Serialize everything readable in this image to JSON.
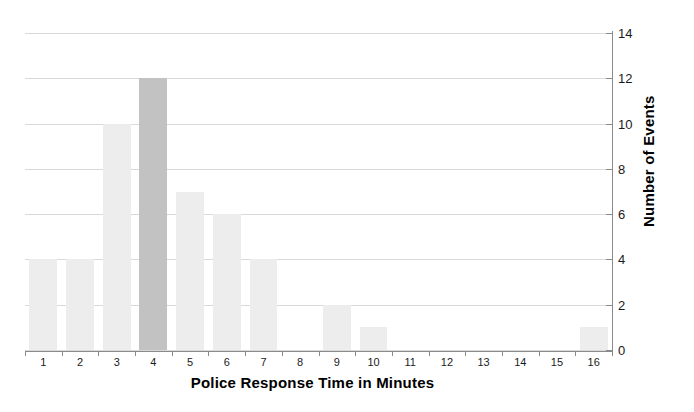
{
  "chart_data": {
    "type": "bar",
    "title": "",
    "xlabel": "Police Response Time in Minutes",
    "ylabel": "Number of Events",
    "categories": [
      "1",
      "2",
      "3",
      "4",
      "5",
      "6",
      "7",
      "8",
      "9",
      "10",
      "11",
      "12",
      "13",
      "14",
      "15",
      "16"
    ],
    "values": [
      4,
      4,
      10,
      12,
      7,
      6,
      4,
      0,
      2,
      1,
      0,
      0,
      0,
      0,
      0,
      1
    ],
    "highlight_index": 3,
    "ylim": [
      0,
      14
    ],
    "y_ticks": [
      "0",
      "2",
      "4",
      "6",
      "8",
      "10",
      "12",
      "14"
    ],
    "y_tick_values": [
      0,
      2,
      4,
      6,
      8,
      10,
      12,
      14
    ],
    "grid": true,
    "y_axis_position": "right",
    "legend": "none",
    "colors": {
      "bar": "#ededed",
      "bar_highlight": "#c2c2c2",
      "gridline": "#d9d9d9",
      "axis": "#8a8a8a",
      "text": "#000000"
    }
  }
}
